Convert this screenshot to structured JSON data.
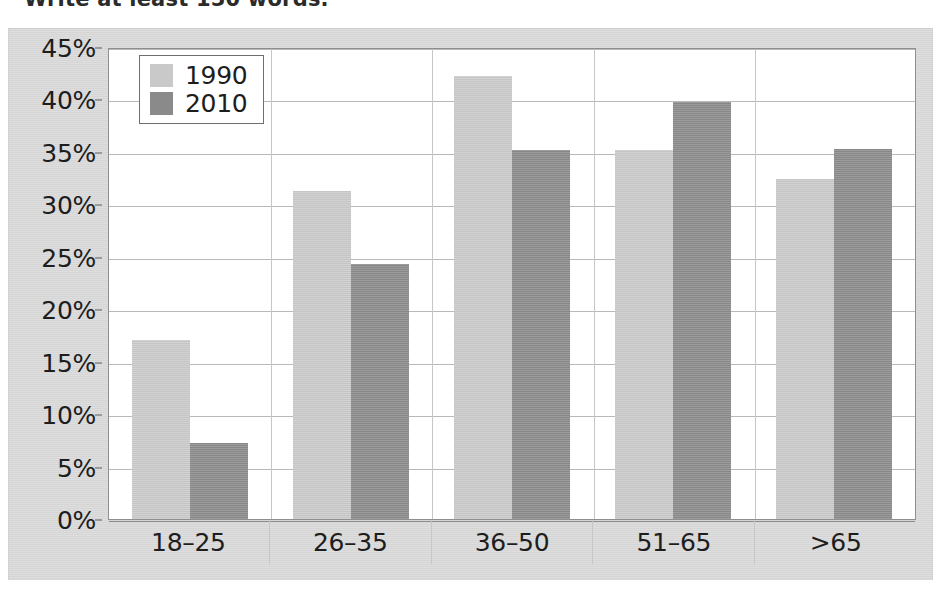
{
  "caption": {
    "text": "Write at least 150 words."
  },
  "chart_data": {
    "type": "bar",
    "title": "",
    "xlabel": "",
    "ylabel": "",
    "categories": [
      "18–25",
      "26–35",
      "36–50",
      "51–65",
      ">65"
    ],
    "series": [
      {
        "name": "1990",
        "color": "#c9c9c9",
        "values": [
          17.1,
          31.3,
          42.2,
          35.2,
          32.4
        ]
      },
      {
        "name": "2010",
        "color": "#8a8a8a",
        "values": [
          7.2,
          24.3,
          35.2,
          39.8,
          35.3
        ]
      }
    ],
    "ylim": [
      0,
      45
    ],
    "ytick_step": 5,
    "ytick_labels": [
      "45%",
      "40%",
      "35%",
      "30%",
      "25%",
      "20%",
      "15%",
      "10%",
      "5%",
      "0%"
    ],
    "ytick_values": [
      45,
      40,
      35,
      30,
      25,
      20,
      15,
      10,
      5,
      0
    ],
    "grid": true,
    "legend_position": "top-left-inside",
    "value_suffix": "%"
  },
  "colors": {
    "panel_background": "#d7d7d7",
    "plot_background": "#ffffff",
    "gridline": "#b9b9b9",
    "axis_line": "#8e8e8e",
    "text": "#1d1d1d"
  }
}
